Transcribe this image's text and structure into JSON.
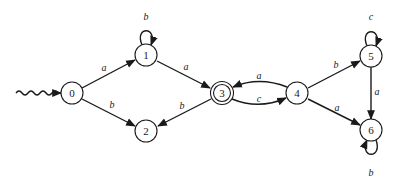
{
  "diagram": {
    "type": "finite-automaton",
    "start_state": "0",
    "accepting_states": [
      "3"
    ],
    "states": [
      {
        "id": "0",
        "label": "0",
        "x": 72,
        "y": 93
      },
      {
        "id": "1",
        "label": "1",
        "x": 146,
        "y": 55
      },
      {
        "id": "2",
        "label": "2",
        "x": 146,
        "y": 131
      },
      {
        "id": "3",
        "label": "3",
        "x": 222,
        "y": 93
      },
      {
        "id": "4",
        "label": "4",
        "x": 297,
        "y": 93
      },
      {
        "id": "5",
        "label": "5",
        "x": 371,
        "y": 56
      },
      {
        "id": "6",
        "label": "6",
        "x": 371,
        "y": 130
      }
    ],
    "transitions": [
      {
        "from": "0",
        "to": "1",
        "label": "a"
      },
      {
        "from": "0",
        "to": "2",
        "label": "b"
      },
      {
        "from": "1",
        "to": "1",
        "label": "b"
      },
      {
        "from": "1",
        "to": "3",
        "label": "a"
      },
      {
        "from": "3",
        "to": "2",
        "label": "b"
      },
      {
        "from": "3",
        "to": "4",
        "label": "c"
      },
      {
        "from": "4",
        "to": "3",
        "label": "a"
      },
      {
        "from": "4",
        "to": "5",
        "label": "b"
      },
      {
        "from": "4",
        "to": "6",
        "label": "a"
      },
      {
        "from": "5",
        "to": "5",
        "label": "c"
      },
      {
        "from": "5",
        "to": "6",
        "label": "a"
      },
      {
        "from": "6",
        "to": "6",
        "label": "b"
      }
    ],
    "colors": {
      "stroke": "#1a1a1a",
      "background": "#ffffff"
    }
  }
}
